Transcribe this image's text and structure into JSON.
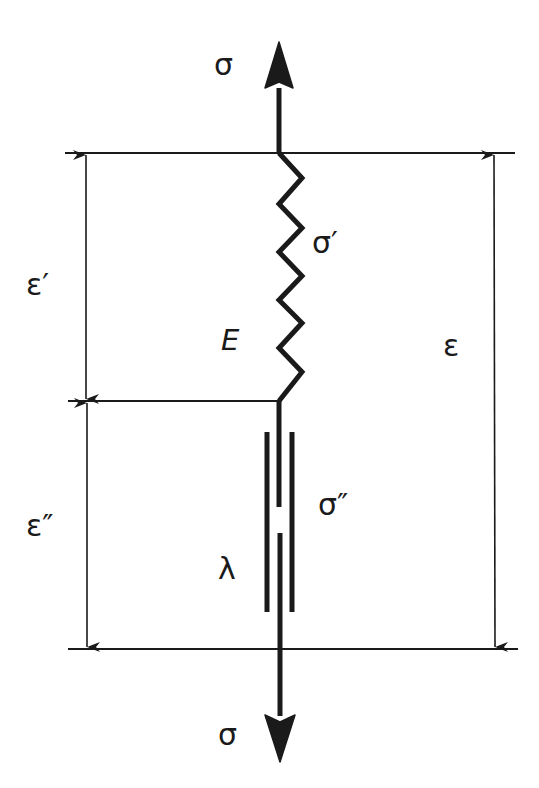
{
  "diagram": {
    "title": "",
    "type": "Maxwell viscoelastic model (spring and dashpot in series)",
    "colors": {
      "stroke": "#1a1a1a",
      "background": "#ffffff"
    },
    "labels": {
      "stress_top": "σ",
      "stress_bottom": "σ",
      "spring_stress": "σ′",
      "spring_modulus": "E",
      "dashpot_stress": "σ″",
      "dashpot_viscosity": "λ",
      "strain_spring": "ε′",
      "strain_dashpot": "ε″",
      "strain_total": "ε"
    },
    "components": [
      {
        "name": "spring",
        "symbol": "E",
        "stress": "σ′",
        "strain": "ε′"
      },
      {
        "name": "dashpot",
        "symbol": "λ",
        "stress": "σ″",
        "strain": "ε″"
      }
    ],
    "dimension_arrows": [
      {
        "label": "ε′",
        "side": "left",
        "span": "top-to-middle"
      },
      {
        "label": "ε″",
        "side": "left",
        "span": "middle-to-bottom"
      },
      {
        "label": "ε",
        "side": "right",
        "span": "top-to-bottom"
      }
    ],
    "force_arrows": [
      {
        "label": "σ",
        "direction": "up",
        "position": "top"
      },
      {
        "label": "σ",
        "direction": "down",
        "position": "bottom"
      }
    ]
  }
}
